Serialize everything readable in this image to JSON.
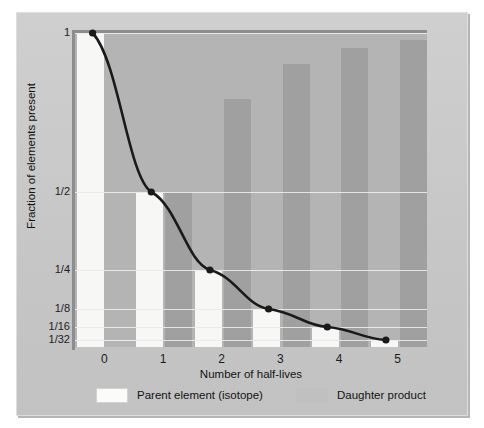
{
  "chart_data": {
    "type": "bar",
    "title": "",
    "xlabel": "Number of half-lives",
    "ylabel": "Fraction of elements present",
    "categories": [
      "0",
      "1",
      "2",
      "3",
      "4",
      "5"
    ],
    "ytick_labels": [
      "1",
      "1/2",
      "1/4",
      "1/8",
      "1/16",
      "1/32"
    ],
    "ytick_values": [
      1,
      0.5,
      0.25,
      0.125,
      0.0625,
      0.03125
    ],
    "ylim": [
      0,
      1
    ],
    "grid": true,
    "legend_position": "bottom",
    "series": [
      {
        "name": "Parent element (isotope)",
        "color": "#f7f7f5",
        "values": [
          1,
          0.5,
          0.25,
          0.125,
          0.0625,
          0.03125
        ]
      },
      {
        "name": "Daughter product",
        "color": "#a0a0a0",
        "values": [
          0,
          0.5,
          0.75,
          0.875,
          0.9375,
          0.96875
        ]
      }
    ],
    "overlay_curve": {
      "name": "decay-curve",
      "color": "#1a1a1a",
      "points": [
        {
          "x": 0,
          "y": 1
        },
        {
          "x": 1,
          "y": 0.5
        },
        {
          "x": 2,
          "y": 0.25
        },
        {
          "x": 3,
          "y": 0.125
        },
        {
          "x": 4,
          "y": 0.0625
        },
        {
          "x": 5,
          "y": 0.03125
        }
      ]
    }
  },
  "axes": {
    "x_label": "Number of half-lives",
    "y_label": "Fraction of elements present",
    "x_ticks": [
      "0",
      "1",
      "2",
      "3",
      "4",
      "5"
    ],
    "y_ticks": [
      "1",
      "1/2",
      "1/4",
      "1/8",
      "1/16",
      "1/32"
    ]
  },
  "legend": {
    "items": [
      {
        "label": "Parent element (isotope)",
        "swatch": "white"
      },
      {
        "label": "Daughter product",
        "swatch": "gray"
      }
    ]
  },
  "colors": {
    "parent": "#f7f7f5",
    "daughter": "#a0a0a0",
    "panel_background": "#b4b4b4",
    "plate_background": "#c8c8c8",
    "curve": "#1a1a1a",
    "gridline": "#e9e9e9"
  }
}
